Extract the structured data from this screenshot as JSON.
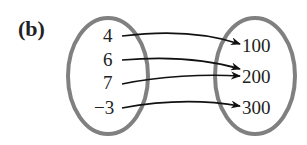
{
  "title": "(b)",
  "domain_set": [
    "4",
    "6",
    "7",
    "−3"
  ],
  "range_set": [
    "100",
    "200",
    "300"
  ],
  "mappings": [
    {
      "from": "4",
      "to": "100"
    },
    {
      "from": "6",
      "to": "200"
    },
    {
      "from": "7",
      "to": "200"
    },
    {
      "from": "−3",
      "to": "300"
    }
  ],
  "colors": {
    "ellipse": "#808080",
    "text": "#222222",
    "arrow": "#111111"
  }
}
